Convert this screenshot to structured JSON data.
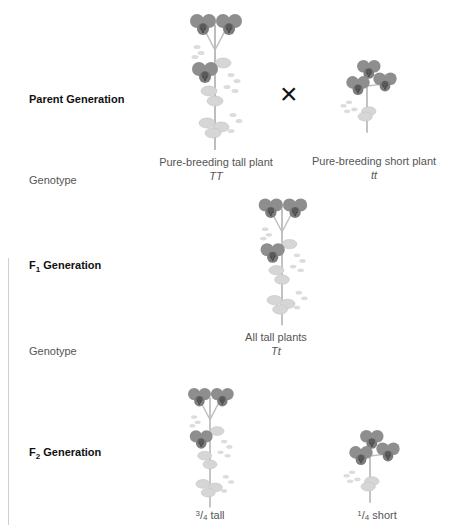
{
  "parent": {
    "label": "Parent Generation",
    "genotype_label": "Genotype",
    "cross_symbol": "×",
    "tall": {
      "caption": "Pure-breeding tall plant",
      "genotype": "TT"
    },
    "short": {
      "caption": "Pure-breeding short plant",
      "genotype": "tt"
    }
  },
  "f1": {
    "label_prefix": "F",
    "label_sub": "1",
    "label_suffix": " Generation",
    "genotype_label": "Genotype",
    "plant": {
      "caption": "All tall plants",
      "genotype": "Tt"
    }
  },
  "f2": {
    "label_prefix": "F",
    "label_sub": "2",
    "label_suffix": " Generation",
    "tall": {
      "num": "3",
      "den": "4",
      "text": " tall"
    },
    "short": {
      "num": "1",
      "den": "4",
      "text": " short"
    }
  },
  "colors": {
    "flower": "#8a8a8a",
    "flower_center": "#5a5a5a",
    "leaf": "#d4d4d4",
    "stem": "#bdbdbd"
  }
}
